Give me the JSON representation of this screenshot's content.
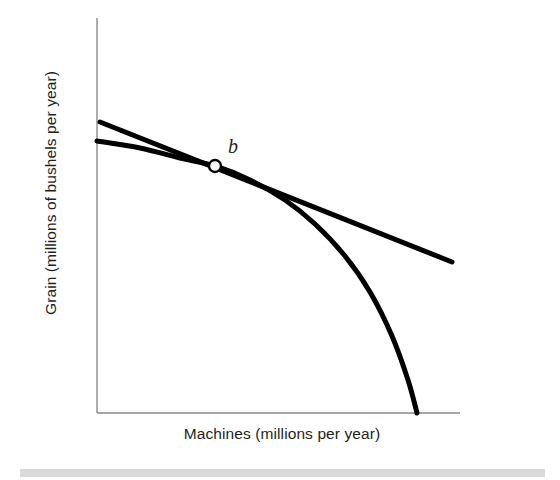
{
  "figure": {
    "name": "production-possibilities-frontier-with-tangent",
    "background_color": "#ffffff",
    "ink_color": "#000000",
    "axis_color": "#8a8a8a",
    "text_color": "#231f20",
    "footer_band_color": "#d4d4d4"
  },
  "labels": {
    "y_axis": "Grain (millions of bushels per year)",
    "x_axis": "Machines (millions per year)",
    "point_b": "b"
  },
  "chart_data": {
    "type": "line",
    "title": "",
    "xlabel": "Machines (millions per year)",
    "ylabel": "Grain (millions of bushels per year)",
    "xlim": [
      0,
      100
    ],
    "ylim": [
      0,
      100
    ],
    "grid": false,
    "legend": "none",
    "axes": {
      "x_axis_pixels": {
        "x1": 97,
        "y1": 413,
        "x2": 460,
        "y2": 413
      },
      "y_axis_pixels": {
        "x1": 97,
        "y1": 18,
        "x2": 97,
        "y2": 413
      },
      "ticks_x": [],
      "ticks_y": [],
      "tick_labels_x": [],
      "tick_labels_y": []
    },
    "series": [
      {
        "name": "production-possibilities-frontier",
        "style": "curve",
        "stroke_width": 5,
        "color": "#000000",
        "description": "Concave-to-origin production possibilities frontier falling from the vertical axis to the horizontal axis",
        "points_pixels": [
          {
            "x": 97,
            "y": 141
          },
          {
            "x": 140,
            "y": 148
          },
          {
            "x": 180,
            "y": 158
          },
          {
            "x": 215,
            "y": 166
          },
          {
            "x": 250,
            "y": 180
          },
          {
            "x": 285,
            "y": 200
          },
          {
            "x": 315,
            "y": 224
          },
          {
            "x": 345,
            "y": 256
          },
          {
            "x": 370,
            "y": 292
          },
          {
            "x": 392,
            "y": 336
          },
          {
            "x": 408,
            "y": 380
          },
          {
            "x": 417,
            "y": 413
          }
        ]
      },
      {
        "name": "tangent-line-at-b",
        "style": "straight-line",
        "stroke_width": 5,
        "color": "#000000",
        "description": "Straight tangent line touching the frontier at point b, showing the marginal rate of transformation",
        "points_pixels": [
          {
            "x": 100,
            "y": 122
          },
          {
            "x": 452,
            "y": 262
          }
        ]
      }
    ],
    "annotations": [
      {
        "name": "point-b",
        "label": "b",
        "marker": "open-circle",
        "marker_radius": 6,
        "marker_fill": "#ffffff",
        "marker_stroke": "#000000",
        "x_pixels": 215,
        "y_pixels": 166,
        "label_x_pixels": 233,
        "label_y_pixels": 150
      }
    ]
  }
}
